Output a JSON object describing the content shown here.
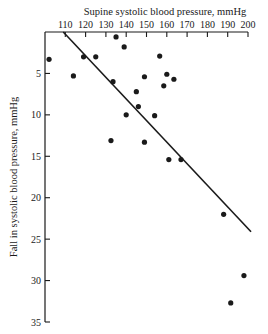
{
  "chart_data": {
    "type": "scatter",
    "title": "",
    "xlabel": "Supine systolic blood pressure, mmHg",
    "ylabel": "Fall in systolic blood pressure, mmHg",
    "x_axis_position": "top",
    "y_axis_inverted": true,
    "xlim": [
      100,
      200
    ],
    "ylim": [
      0,
      35
    ],
    "xticks": [
      110,
      120,
      130,
      140,
      150,
      160,
      170,
      180,
      190,
      200
    ],
    "yticks": [
      5,
      10,
      15,
      20,
      25,
      30,
      35
    ],
    "grid": false,
    "legend": null,
    "series": [
      {
        "name": "observations",
        "points": [
          {
            "x": 102,
            "y": 3.3
          },
          {
            "x": 114,
            "y": 5.3
          },
          {
            "x": 119,
            "y": 3.0
          },
          {
            "x": 125,
            "y": 3.0
          },
          {
            "x": 135,
            "y": 0.6
          },
          {
            "x": 139,
            "y": 1.8
          },
          {
            "x": 133.5,
            "y": 6.0
          },
          {
            "x": 145,
            "y": 7.2
          },
          {
            "x": 146,
            "y": 9.0
          },
          {
            "x": 140,
            "y": 10.0
          },
          {
            "x": 154,
            "y": 10.1
          },
          {
            "x": 132.5,
            "y": 13.1
          },
          {
            "x": 149,
            "y": 13.3
          },
          {
            "x": 161,
            "y": 15.4
          },
          {
            "x": 167,
            "y": 15.4
          },
          {
            "x": 149,
            "y": 5.4
          },
          {
            "x": 156.5,
            "y": 2.9
          },
          {
            "x": 160,
            "y": 5.1
          },
          {
            "x": 163.5,
            "y": 5.7
          },
          {
            "x": 158.5,
            "y": 6.5
          },
          {
            "x": 188,
            "y": 22.0
          },
          {
            "x": 198,
            "y": 29.4
          },
          {
            "x": 191.5,
            "y": 32.7
          }
        ]
      }
    ],
    "regression_line": {
      "x1": 109,
      "y1": 0,
      "x2": 201.5,
      "y2": 24.1
    }
  },
  "colors": {
    "ink": "#1a1a1a",
    "background": "#ffffff"
  }
}
